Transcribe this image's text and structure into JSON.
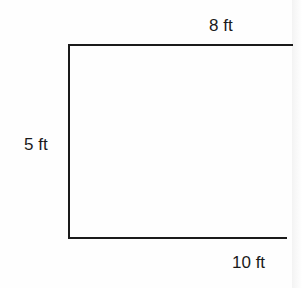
{
  "diagram": {
    "type": "open-rectangle-dimension-figure",
    "labels": {
      "top": "8 ft",
      "left": "5 ft",
      "bottom": "10 ft"
    },
    "colors": {
      "stroke": "#1a1a1a",
      "background": "#fefefe"
    }
  }
}
